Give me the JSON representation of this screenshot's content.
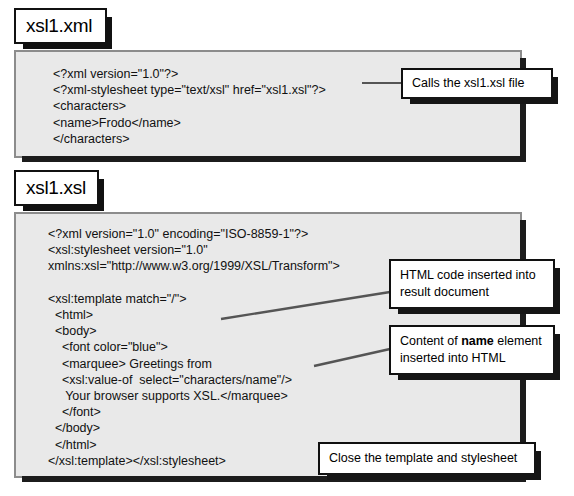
{
  "figure": {
    "panels": [
      {
        "id": "xml",
        "title": "xsl1.xml",
        "code": "<?xml version=\"1.0\"?>\n<?xml-stylesheet type=\"text/xsl\" href=\"xsl1.xsl\"?>\n<characters>\n<name>Frodo</name>\n</characters>"
      },
      {
        "id": "xsl",
        "title": "xsl1.xsl",
        "code": "<?xml version=\"1.0\" encoding=\"ISO-8859-1\"?>\n<xsl:stylesheet version=\"1.0\"\nxmlns:xsl=\"http://www.w3.org/1999/XSL/Transform\">\n\n<xsl:template match=\"/\">\n  <html>\n  <body>\n    <font color=\"blue\">\n    <marquee> Greetings from\n    <xsl:value-of  select=\"characters/name\"/>\n     Your browser supports XSL.</marquee>\n    </font>\n  </body>\n  </html>\n</xsl:template></xsl:stylesheet>"
      }
    ],
    "callouts": [
      {
        "id": "calls-file",
        "text": "Calls the xsl1.xsl file"
      },
      {
        "id": "html-code-inserted",
        "line1": "HTML code inserted into",
        "line2": "result document"
      },
      {
        "id": "name-content",
        "prefix": "Content of ",
        "emphasis": "name",
        "suffix": " element",
        "line2": "inserted into HTML"
      },
      {
        "id": "close-template",
        "text": "Close the template and stylesheet"
      }
    ],
    "colors": {
      "panel_fill": "#e9e9e9",
      "panel_border": "#8c8c8c",
      "shadow": "#1c1c1c",
      "callout_fill": "#ffffff",
      "callout_border": "#101010",
      "text": "#111111",
      "connector": "#555555"
    }
  }
}
